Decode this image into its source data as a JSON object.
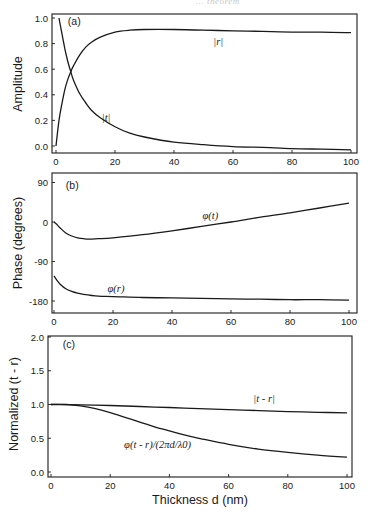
{
  "page": {
    "header_fragment": "... theorem"
  },
  "chart_data": [
    {
      "panel": "(a)",
      "type": "line",
      "xlabel": "",
      "ylabel": "Amplitude",
      "xlim": [
        0,
        100
      ],
      "ylim": [
        -0.03,
        1.03
      ],
      "xticks": [
        0,
        20,
        40,
        60,
        80,
        100
      ],
      "yticks": [
        0.0,
        0.2,
        0.4,
        0.6,
        0.8,
        1.0
      ],
      "ytick_labels": [
        "0.0",
        "0.2",
        "0.4",
        "0.6",
        "0.8",
        "1.0"
      ],
      "grid": false,
      "series": [
        {
          "name": "|r|",
          "x": [
            0,
            1,
            2,
            3,
            4,
            5,
            6,
            8,
            10,
            12,
            15,
            20,
            25,
            30,
            40,
            50,
            60,
            70,
            80,
            90,
            100
          ],
          "values": [
            0.0,
            0.2,
            0.33,
            0.44,
            0.52,
            0.58,
            0.63,
            0.71,
            0.77,
            0.81,
            0.85,
            0.89,
            0.905,
            0.91,
            0.91,
            0.905,
            0.9,
            0.895,
            0.89,
            0.89,
            0.885
          ]
        },
        {
          "name": "|t|",
          "x": [
            1,
            2,
            3,
            4,
            5,
            6,
            8,
            10,
            12,
            15,
            20,
            25,
            30,
            40,
            50,
            60,
            70,
            80,
            90,
            100
          ],
          "values": [
            1.0,
            0.88,
            0.76,
            0.66,
            0.58,
            0.51,
            0.41,
            0.34,
            0.28,
            0.22,
            0.15,
            0.1,
            0.07,
            0.03,
            0.01,
            -0.005,
            -0.01,
            -0.02,
            -0.025,
            -0.03
          ]
        }
      ],
      "annotations": [
        {
          "text": "(a)",
          "x": 4,
          "y": 0.98
        },
        {
          "text": "|r|",
          "x": 55,
          "y": 0.82
        },
        {
          "text": "|t|",
          "x": 17,
          "y": 0.23
        }
      ]
    },
    {
      "panel": "(b)",
      "type": "line",
      "xlabel": "",
      "ylabel": "Phase (degrees)",
      "xlim": [
        0,
        100
      ],
      "ylim": [
        -210,
        105
      ],
      "xticks": [
        0,
        20,
        40,
        60,
        80,
        100
      ],
      "yticks": [
        90,
        0,
        -90,
        -180
      ],
      "ytick_labels": [
        "90",
        "0",
        "-90",
        "-180"
      ],
      "grid": false,
      "series": [
        {
          "name": "φ(t)",
          "x": [
            0,
            1,
            2,
            4,
            6,
            8,
            10,
            12,
            15,
            20,
            30,
            40,
            50,
            60,
            70,
            80,
            90,
            100
          ],
          "values": [
            0,
            -6,
            -13,
            -25,
            -32,
            -36,
            -38,
            -39,
            -38,
            -36,
            -29,
            -20,
            -10,
            0,
            11,
            21,
            32,
            43
          ]
        },
        {
          "name": "φ(r)",
          "x": [
            0,
            1,
            2,
            4,
            6,
            8,
            10,
            15,
            20,
            30,
            40,
            50,
            60,
            70,
            80,
            90,
            100
          ],
          "values": [
            -123,
            -133,
            -141,
            -152,
            -158,
            -162,
            -165,
            -169,
            -170,
            -172,
            -173,
            -174,
            -175,
            -176,
            -177,
            -177,
            -178
          ]
        }
      ],
      "annotations": [
        {
          "text": "(b)",
          "x": 4,
          "y": 84
        },
        {
          "text": "φ(t)",
          "x": 53,
          "y": 15
        },
        {
          "text": "φ(r)",
          "x": 21,
          "y": -150
        }
      ]
    },
    {
      "panel": "(c)",
      "type": "line",
      "xlabel": "Thickness d (nm)",
      "ylabel": "Normalized (t - r)",
      "xlim": [
        0,
        100
      ],
      "ylim": [
        -0.03,
        2.03
      ],
      "xticks": [
        0,
        20,
        40,
        60,
        80,
        100
      ],
      "yticks": [
        0.0,
        0.5,
        1.0,
        1.5,
        2.0
      ],
      "ytick_labels": [
        "0.0",
        "0.5",
        "1.0",
        "1.5",
        "2.0"
      ],
      "grid": false,
      "series": [
        {
          "name": "|t - r|",
          "x": [
            0,
            10,
            20,
            30,
            40,
            50,
            60,
            70,
            80,
            90,
            100
          ],
          "values": [
            1.0,
            0.995,
            0.985,
            0.97,
            0.955,
            0.94,
            0.925,
            0.91,
            0.895,
            0.885,
            0.875
          ]
        },
        {
          "name": "φ(t - r)/(2πd/λ0)",
          "x": [
            0,
            5,
            10,
            15,
            20,
            25,
            30,
            35,
            40,
            45,
            50,
            60,
            70,
            80,
            90,
            100
          ],
          "values": [
            1.0,
            1.0,
            0.98,
            0.94,
            0.88,
            0.81,
            0.74,
            0.67,
            0.61,
            0.55,
            0.5,
            0.41,
            0.34,
            0.29,
            0.25,
            0.22
          ]
        }
      ],
      "annotations": [
        {
          "text": "(c)",
          "x": 4,
          "y": 1.9
        },
        {
          "text": "|t - r|",
          "x": 72,
          "y": 1.1
        },
        {
          "text": "φ(t - r)/(2πd/λ0)",
          "x": 36,
          "y": 0.42
        }
      ]
    }
  ]
}
